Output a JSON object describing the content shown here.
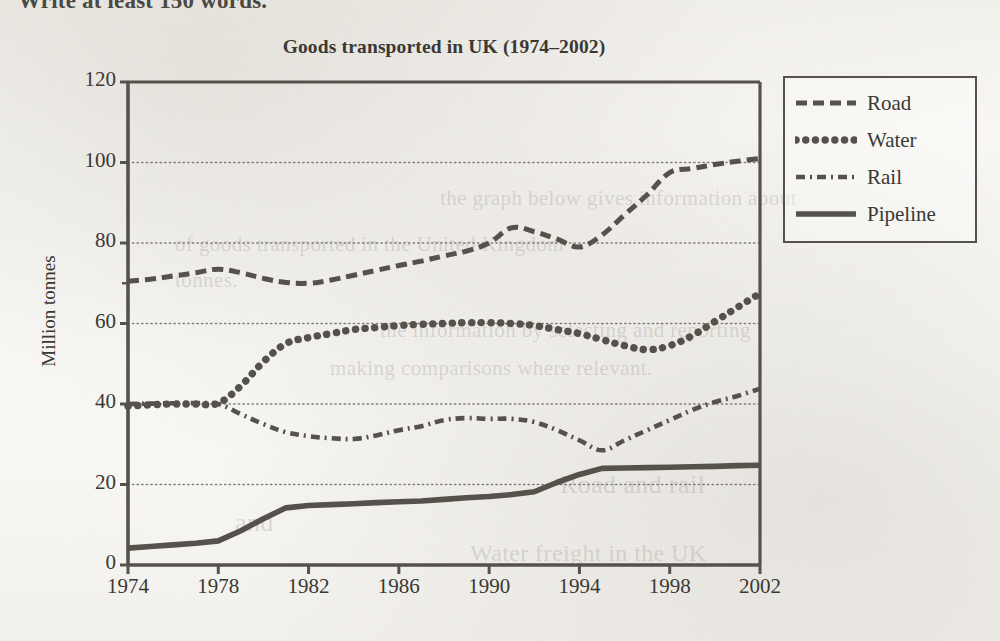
{
  "page": {
    "prompt_text": "Write at least 150 words.",
    "bleed_texts": [
      "the graph below gives information about",
      "of goods transported in the United Kingdom",
      "tonnes.",
      "the information by selecting and reporting",
      "making comparisons where relevant.",
      "Road and rail",
      "and",
      "Water freight in the UK"
    ]
  },
  "chart_data": {
    "type": "line",
    "title": "Goods transported in UK (1974–2002)",
    "xlabel": "",
    "ylabel": "Million tonnes",
    "xlim": [
      1974,
      2002
    ],
    "ylim": [
      0,
      120
    ],
    "ytick_values": [
      0,
      20,
      40,
      60,
      80,
      100,
      120
    ],
    "ytick_labels": [
      "0",
      "20",
      "40",
      "60",
      "80",
      "100",
      "120"
    ],
    "xtick_values": [
      1974,
      1978,
      1982,
      1986,
      1990,
      1994,
      1998,
      2002
    ],
    "xtick_labels": [
      "1974",
      "1978",
      "1982",
      "1986",
      "1990",
      "1994",
      "1998",
      "2002"
    ],
    "grid": "horizontal-dotted",
    "legend_position": "right-outside",
    "x": [
      1974,
      1975,
      1976,
      1977,
      1978,
      1979,
      1980,
      1981,
      1982,
      1983,
      1984,
      1985,
      1986,
      1987,
      1988,
      1989,
      1990,
      1991,
      1992,
      1993,
      1994,
      1995,
      1996,
      1997,
      1998,
      1999,
      2000,
      2001,
      2002
    ],
    "series": [
      {
        "name": "Road",
        "style": "dashed",
        "color": "#55524c",
        "values": [
          70.5,
          71.0,
          71.8,
          72.6,
          73.5,
          72.6,
          71.2,
          70.2,
          70.0,
          70.8,
          72.0,
          73.2,
          74.4,
          75.5,
          76.8,
          78.0,
          80.0,
          83.8,
          82.8,
          81.0,
          79.0,
          82.0,
          87.0,
          92.0,
          97.5,
          98.5,
          99.5,
          100.3,
          101.0
        ]
      },
      {
        "name": "Water",
        "style": "dotted",
        "color": "#55524c",
        "values": [
          39.5,
          39.8,
          40.0,
          40.0,
          40.2,
          44.5,
          50.5,
          55.0,
          56.5,
          57.5,
          58.5,
          59.0,
          59.5,
          59.8,
          60.0,
          60.2,
          60.2,
          60.0,
          59.5,
          58.5,
          57.5,
          56.0,
          54.5,
          53.5,
          54.5,
          57.0,
          60.5,
          64.0,
          67.5
        ]
      },
      {
        "name": "Rail",
        "style": "dashdot",
        "color": "#55524c",
        "values": [
          40.0,
          40.1,
          40.2,
          40.2,
          40.0,
          37.5,
          35.0,
          33.0,
          32.0,
          31.5,
          31.3,
          32.2,
          33.5,
          34.5,
          36.0,
          36.5,
          36.3,
          36.3,
          35.5,
          33.5,
          31.0,
          28.5,
          31.0,
          33.5,
          36.0,
          38.5,
          40.5,
          42.0,
          43.8
        ]
      },
      {
        "name": "Pipeline",
        "style": "solid",
        "color": "#55524c",
        "values": [
          4.2,
          4.6,
          5.0,
          5.4,
          6.0,
          8.5,
          11.5,
          14.2,
          14.8,
          15.0,
          15.2,
          15.5,
          15.7,
          15.9,
          16.3,
          16.7,
          17.0,
          17.5,
          18.2,
          20.5,
          22.5,
          24.0,
          24.1,
          24.2,
          24.3,
          24.4,
          24.5,
          24.7,
          24.8
        ]
      }
    ]
  }
}
